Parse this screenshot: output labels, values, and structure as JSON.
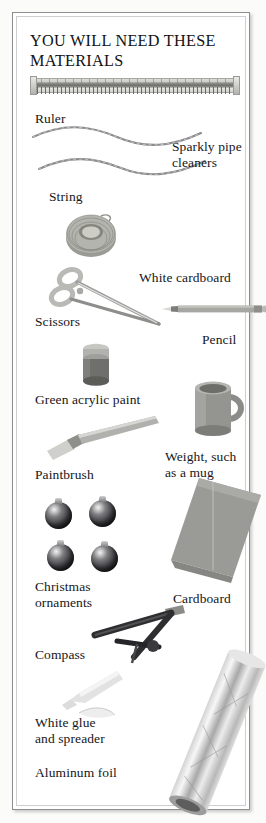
{
  "page": {
    "heading": "YOU WILL NEED THESE\nMATERIALS",
    "background_color": "#ffffff",
    "frame_color": "#8e8e90",
    "text_color": "#16161a"
  },
  "materials": [
    {
      "id": "ruler",
      "label": "Ruler",
      "icon": "ruler-photo"
    },
    {
      "id": "pipe-cleaners",
      "label": "Sparkly pipe\ncleaners",
      "icon": "pipe-cleaners-photo"
    },
    {
      "id": "string",
      "label": "String",
      "icon": "string-coil-photo"
    },
    {
      "id": "scissors",
      "label": "Scissors",
      "icon": "scissors-photo"
    },
    {
      "id": "white-cardboard",
      "label": "White cardboard",
      "icon": "white-cardboard-photo"
    },
    {
      "id": "pencil",
      "label": "Pencil",
      "icon": "pencil-photo"
    },
    {
      "id": "green-paint",
      "label": "Green acrylic paint",
      "icon": "paint-jar-photo"
    },
    {
      "id": "weight-mug",
      "label": "Weight, such\nas a mug",
      "icon": "mug-photo"
    },
    {
      "id": "paintbrush",
      "label": "Paintbrush",
      "icon": "paintbrush-photo"
    },
    {
      "id": "ornaments",
      "label": "Christmas\nornaments",
      "icon": "christmas-ornaments-photo"
    },
    {
      "id": "cardboard",
      "label": "Cardboard",
      "icon": "cardboard-sheet-photo"
    },
    {
      "id": "compass",
      "label": "Compass",
      "icon": "compass-photo"
    },
    {
      "id": "white-glue",
      "label": "White glue\nand spreader",
      "icon": "glue-and-spreader-photo"
    },
    {
      "id": "aluminum-foil",
      "label": "Aluminum foil",
      "icon": "aluminum-foil-roll-photo"
    }
  ]
}
